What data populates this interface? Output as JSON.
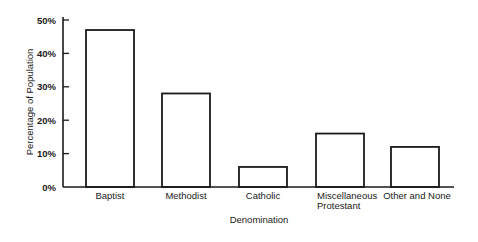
{
  "chart_data": {
    "type": "bar",
    "title": "",
    "xlabel": "Denomination",
    "ylabel": "Percentage of Population",
    "categories": [
      "Baptist",
      "Methodist",
      "Catholic",
      "Miscellaneous Protestant",
      "Other and None"
    ],
    "category_lines": [
      [
        "Baptist"
      ],
      [
        "Methodist"
      ],
      [
        "Catholic"
      ],
      [
        "Miscellaneous",
        "Protestant"
      ],
      [
        "Other and None"
      ]
    ],
    "values": [
      47,
      28,
      6,
      16,
      12
    ],
    "ylim": [
      0,
      50
    ],
    "yticks": [
      0,
      10,
      20,
      30,
      40,
      50
    ],
    "ytick_labels": [
      "0%",
      "10%",
      "20%",
      "30%",
      "40%",
      "50%"
    ],
    "grid": false,
    "legend": null,
    "bar_fill": "#ffffff",
    "bar_stroke": "#1a1a1a"
  }
}
